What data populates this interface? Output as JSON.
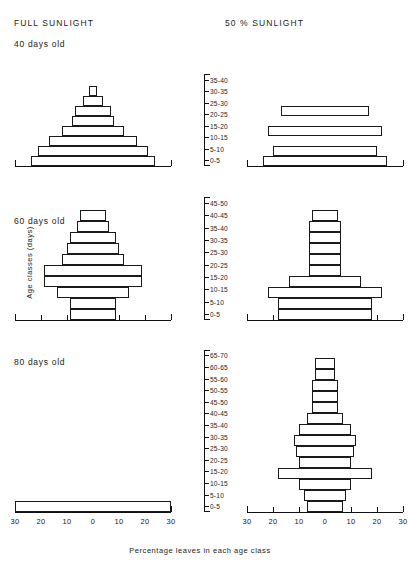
{
  "headers": {
    "left": "FULL  SUNLIGHT",
    "right": "50 %  SUNLIGHT"
  },
  "panel_titles": {
    "p40": "40 days old",
    "p60": "60 days old",
    "p80": "80 days old"
  },
  "axis": {
    "y_title": "Age classes (days)",
    "x_title": "Percentage leaves in each age class",
    "x_ticklabels": [
      "30",
      "20",
      "10",
      "0",
      "10",
      "20",
      "30"
    ],
    "x_tickvalues": [
      -30,
      -20,
      -10,
      0,
      10,
      20,
      30
    ],
    "x_min": -30,
    "x_max": 30
  },
  "chart_data": [
    {
      "type": "bar",
      "title": "40 days old - Full sunlight",
      "subtitle": "FULL SUNLIGHT",
      "orientation": "horizontal-pyramid",
      "xlabel": "Percentage leaves in each age class",
      "ylabel": "Age classes (days)",
      "xlim": [
        -30,
        30
      ],
      "grid": false,
      "legend": "none",
      "categories": [
        "0-5",
        "5-10",
        "10-15",
        "15-20",
        "20-25",
        "25-30",
        "30-35",
        "35-40"
      ],
      "values": [
        24,
        21,
        17,
        12,
        8,
        7,
        4,
        1.5
      ]
    },
    {
      "type": "bar",
      "title": "40 days old - 50% sunlight",
      "subtitle": "50 % SUNLIGHT",
      "orientation": "horizontal-pyramid",
      "xlabel": "Percentage leaves in each age class",
      "ylabel": "Age classes (days)",
      "xlim": [
        -30,
        30
      ],
      "grid": false,
      "legend": "none",
      "categories": [
        "0-5",
        "5-10",
        "10-15",
        "15-20",
        "20-25",
        "25-30",
        "30-35",
        "35-40"
      ],
      "values": [
        24,
        20,
        0,
        22,
        0,
        17,
        0,
        0
      ]
    },
    {
      "type": "bar",
      "title": "60 days old - Full sunlight",
      "subtitle": "FULL SUNLIGHT",
      "orientation": "horizontal-pyramid",
      "xlabel": "Percentage leaves in each age class",
      "ylabel": "Age classes (days)",
      "xlim": [
        -30,
        30
      ],
      "grid": false,
      "legend": "none",
      "categories": [
        "0-5",
        "5-10",
        "10-15",
        "15-20",
        "20-25",
        "25-30",
        "30-35",
        "35-40",
        "40-45",
        "45-50"
      ],
      "values": [
        9,
        9,
        14,
        19,
        19,
        12,
        10,
        9,
        6,
        5
      ]
    },
    {
      "type": "bar",
      "title": "60 days old - 50% sunlight",
      "subtitle": "50 % SUNLIGHT",
      "orientation": "horizontal-pyramid",
      "xlabel": "Percentage leaves in each age class",
      "ylabel": "Age classes (days)",
      "xlim": [
        -30,
        30
      ],
      "grid": false,
      "legend": "none",
      "categories": [
        "0-5",
        "5-10",
        "10-15",
        "15-20",
        "20-25",
        "25-30",
        "30-35",
        "35-40",
        "40-45",
        "45-50"
      ],
      "values": [
        18,
        18,
        22,
        14,
        6,
        6,
        6,
        6,
        6,
        5
      ]
    },
    {
      "type": "bar",
      "title": "80 days old - Full sunlight",
      "subtitle": "FULL SUNLIGHT",
      "orientation": "horizontal-pyramid",
      "xlabel": "Percentage leaves in each age class",
      "ylabel": "Age classes (days)",
      "xlim": [
        -30,
        30
      ],
      "grid": false,
      "legend": "none",
      "categories": [
        "0-5",
        "5-10",
        "10-15",
        "15-20",
        "20-25",
        "25-30",
        "30-35",
        "35-40",
        "40-45",
        "45-50",
        "50-55",
        "55-60",
        "60-65",
        "65-70"
      ],
      "values": [
        30,
        0,
        0,
        0,
        0,
        0,
        0,
        0,
        0,
        0,
        0,
        0,
        0,
        0
      ]
    },
    {
      "type": "bar",
      "title": "80 days old - 50% sunlight",
      "subtitle": "50 % SUNLIGHT",
      "orientation": "horizontal-pyramid",
      "xlabel": "Percentage leaves in each age class",
      "ylabel": "Age classes (days)",
      "xlim": [
        -30,
        30
      ],
      "grid": false,
      "legend": "none",
      "categories": [
        "0-5",
        "5-10",
        "10-15",
        "15-20",
        "20-25",
        "25-30",
        "30-35",
        "35-40",
        "40-45",
        "45-50",
        "50-55",
        "55-60",
        "60-65",
        "65-70"
      ],
      "values": [
        7,
        8,
        10,
        18,
        10,
        11,
        12,
        10,
        7,
        5,
        5,
        5,
        4,
        4
      ]
    }
  ],
  "class_axes": {
    "p40": [
      "0-5",
      "5-10",
      "10-15",
      "15-20",
      "20-25",
      "25-30",
      "30-35",
      "35-40"
    ],
    "p60": [
      "0-5",
      "5-10",
      "10-15",
      "15-20",
      "20-25",
      "25-30",
      "30-35",
      "35-40",
      "40-45",
      "45-50"
    ],
    "p80": [
      "0-5",
      "5-10",
      "10-15",
      "15-20",
      "20-25",
      "25-30",
      "30-35",
      "35-40",
      "40-45",
      "45-50",
      "50-55",
      "55-60",
      "60-65",
      "65-70"
    ]
  }
}
